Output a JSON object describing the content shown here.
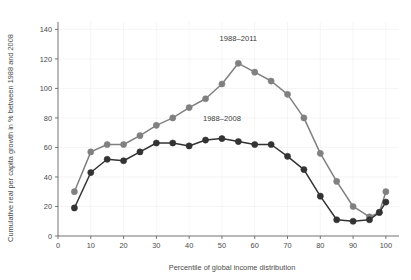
{
  "chart_data": {
    "type": "line",
    "title": "",
    "xlabel": "Percentile of global income distribution",
    "ylabel": "Cumulative real per capita growth in % between 1988 and 2008",
    "xlim": [
      0,
      104
    ],
    "ylim": [
      0,
      145
    ],
    "xticks": [
      0,
      10,
      20,
      30,
      40,
      50,
      60,
      70,
      80,
      90,
      100
    ],
    "yticks": [
      0,
      20,
      40,
      60,
      80,
      100,
      120,
      140
    ],
    "grid": false,
    "legend_position": "inline-annotation",
    "series": [
      {
        "name": "1988–2011",
        "color": "#808080",
        "marker": "circle",
        "annotation": "1988–2011",
        "x": [
          5,
          10,
          15,
          20,
          25,
          30,
          35,
          40,
          45,
          50,
          55,
          60,
          65,
          70,
          75,
          80,
          85,
          90,
          95,
          98,
          100
        ],
        "values": [
          30,
          57,
          62,
          62,
          68,
          75,
          80,
          87,
          93,
          103,
          117,
          111,
          105,
          96,
          80,
          56,
          37,
          20,
          13,
          16,
          30
        ]
      },
      {
        "name": "1988–2008",
        "color": "#333333",
        "marker": "circle",
        "annotation": "1988–2008",
        "x": [
          5,
          10,
          15,
          20,
          25,
          30,
          35,
          40,
          45,
          50,
          55,
          60,
          65,
          70,
          75,
          80,
          85,
          90,
          95,
          98,
          100
        ],
        "values": [
          19,
          43,
          52,
          51,
          57,
          63,
          63,
          61,
          65,
          66,
          64,
          62,
          62,
          54,
          45,
          27,
          11,
          10,
          11,
          16,
          23
        ]
      }
    ],
    "annotations": [
      {
        "text": "1988–2011",
        "x": 55,
        "y": 132
      },
      {
        "text": "1988–2008",
        "x": 50,
        "y": 78
      }
    ]
  },
  "axis": {
    "y_tick_labels": [
      "0",
      "20",
      "40",
      "60",
      "80",
      "100",
      "120",
      "140"
    ],
    "x_tick_labels": [
      "0",
      "10",
      "20",
      "30",
      "40",
      "50",
      "60",
      "70",
      "80",
      "90",
      "100"
    ],
    "y_axis_title": "Cumulative real per capita growth in % between 1988 and 2008",
    "x_axis_title": "Percentile of global income distribution"
  },
  "colors": {
    "series_2011": "#808080",
    "series_2008": "#333333",
    "axis": "#555555",
    "background": "#ffffff",
    "text": "#4a4a4a"
  }
}
